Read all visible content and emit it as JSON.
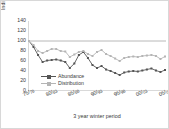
{
  "chart_data": {
    "type": "line",
    "title": "",
    "xlabel": "3 year winter period",
    "ylabel": "Indices 75-78=100",
    "ylim": [
      0,
      140
    ],
    "yticks": [
      140,
      120,
      100,
      80,
      60,
      40,
      20,
      0
    ],
    "grid": false,
    "reference_line": {
      "y": 100,
      "color": "#b0b0b0"
    },
    "legend_position": "inside-lower-left",
    "categories": [
      "75/78",
      "76/79",
      "77/80",
      "78/81",
      "79/82",
      "80/83",
      "81/84",
      "82/85",
      "83/86",
      "84/87",
      "85/88",
      "86/89",
      "87/90",
      "88/91",
      "89/92",
      "90/93",
      "91/94",
      "92/95",
      "93/96",
      "94/97",
      "95/98",
      "96/99",
      "97/00",
      "98/01",
      "99/02",
      "00/03",
      "01/04",
      "02/05",
      "03/06",
      "04/07",
      "05/08"
    ],
    "xtick_labels": [
      "75/78",
      "80/83",
      "85/88",
      "90/93",
      "95/98",
      "00/03",
      "05/08"
    ],
    "xtick_indices": [
      0,
      5,
      10,
      15,
      20,
      25,
      30
    ],
    "series": [
      {
        "name": "Abundance",
        "color": "#555555",
        "marker": "square",
        "values": [
          100,
          88,
          72,
          58,
          61,
          62,
          63,
          61,
          58,
          46,
          55,
          72,
          78,
          66,
          52,
          46,
          50,
          43,
          40,
          36,
          32,
          37,
          39,
          40,
          39,
          41,
          43,
          45,
          41,
          38,
          42
        ]
      },
      {
        "name": "Distribution",
        "color": "#b5b5b5",
        "marker": "square",
        "values": [
          100,
          92,
          80,
          76,
          80,
          84,
          84,
          80,
          79,
          68,
          73,
          78,
          80,
          74,
          70,
          78,
          82,
          74,
          70,
          65,
          60,
          66,
          68,
          69,
          68,
          70,
          71,
          72,
          70,
          64,
          69
        ]
      }
    ]
  },
  "figure": {
    "border_color": "#d8d8d8",
    "background": "#ffffff",
    "axis_color": "#808080",
    "text_color": "#3a3a3a"
  }
}
